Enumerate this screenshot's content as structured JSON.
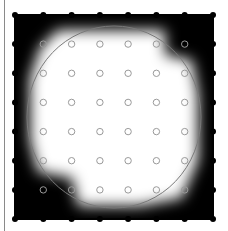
{
  "figure": {
    "colors": {
      "background": "#ffffff",
      "field_dark": "#000000",
      "field_light": "#ffffff",
      "boundary_dots": "#000000",
      "interior_markers": "#9a9a9a",
      "ellipse": "#7a7a7a",
      "frame_line": "#8a8a8a"
    },
    "grid": {
      "columns": 8,
      "rows": 8,
      "x_range": [
        15,
        213
      ],
      "y_range": [
        15,
        219
      ],
      "boundary_marker": "filled-dot",
      "interior_marker": "open-circle"
    },
    "field": {
      "x": 15,
      "y": 15,
      "width": 198,
      "height": 204
    },
    "ellipse": {
      "cx": 114,
      "cy": 117,
      "rx": 87,
      "ry": 91
    }
  }
}
